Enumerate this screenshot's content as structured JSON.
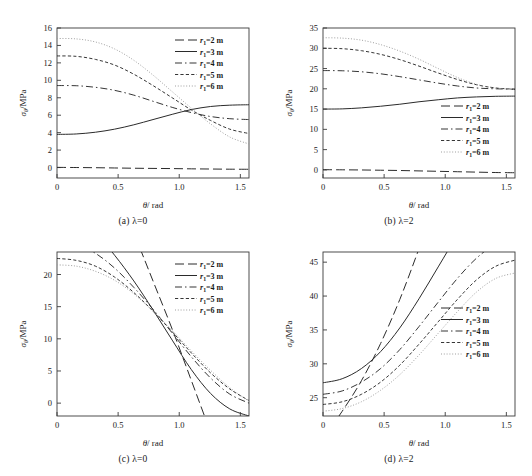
{
  "figure": {
    "panels": [
      {
        "id": "a",
        "caption": "(a)  λ=0",
        "xlabel": "θ/ rad",
        "ylabel": "σθ/MPa",
        "legend_position": "top-right"
      },
      {
        "id": "b",
        "caption": "(b)  λ=2",
        "xlabel": "θ/ rad",
        "ylabel": "σθ/MPa",
        "legend_position": "bottom-right"
      },
      {
        "id": "c",
        "caption": "(c)  λ=0",
        "xlabel": "θ/ rad",
        "ylabel": "σθ/MPa",
        "legend_position": "top-right"
      },
      {
        "id": "d",
        "caption": "(d)  λ=2",
        "xlabel": "θ/ rad",
        "ylabel": "σθ/MPa",
        "legend_position": "middle-right"
      }
    ],
    "legend_entries": [
      {
        "label_pre": "r",
        "label_sub": "1",
        "label_post": "=2 m",
        "style": "dashed"
      },
      {
        "label_pre": "r",
        "label_sub": "1",
        "label_post": "=3 m",
        "style": "solid"
      },
      {
        "label_pre": "r",
        "label_sub": "1",
        "label_post": "=4 m",
        "style": "dashdot"
      },
      {
        "label_pre": "r",
        "label_sub": "1",
        "label_post": "=5 m",
        "style": "shortdash"
      },
      {
        "label_pre": "r",
        "label_sub": "1",
        "label_post": "=6 m",
        "style": "dotted"
      }
    ]
  },
  "chart_data": [
    {
      "panel": "a",
      "type": "line",
      "title": "(a) λ=0",
      "xlabel": "θ/ rad",
      "ylabel": "σθ/MPa",
      "xlim": [
        0,
        1.5708
      ],
      "ylim": [
        -1.2,
        16
      ],
      "xticks": [
        0,
        0.5,
        1.0,
        1.5
      ],
      "xticklabels": [
        "0",
        "0.5",
        "1.0",
        "1.5"
      ],
      "yticks": [
        0,
        2,
        4,
        6,
        8,
        10,
        12,
        14,
        16
      ],
      "yticklabels": [
        "0",
        "2",
        "4",
        "6",
        "8",
        "10",
        "12",
        "14",
        "16"
      ],
      "grid": false,
      "legend": "top-right",
      "x": [
        0,
        0.1571,
        0.3142,
        0.4712,
        0.6283,
        0.7854,
        0.9425,
        1.0996,
        1.2566,
        1.4137,
        1.5708
      ],
      "series": [
        {
          "name": "r1=2 m",
          "style": "dashed",
          "values": [
            0.02,
            0.0,
            -0.02,
            -0.05,
            -0.08,
            -0.1,
            -0.12,
            -0.15,
            -0.17,
            -0.19,
            -0.2
          ]
        },
        {
          "name": "r1=3 m",
          "style": "solid",
          "values": [
            3.8,
            3.85,
            4.05,
            4.4,
            4.9,
            5.5,
            6.1,
            6.65,
            7.0,
            7.15,
            7.2
          ]
        },
        {
          "name": "r1=4 m",
          "style": "dashdot",
          "values": [
            9.4,
            9.38,
            9.2,
            8.85,
            8.3,
            7.6,
            6.9,
            6.3,
            5.85,
            5.6,
            5.5
          ]
        },
        {
          "name": "r1=5 m",
          "style": "shortdash",
          "values": [
            12.8,
            12.75,
            12.4,
            11.75,
            10.7,
            9.4,
            8.0,
            6.6,
            5.4,
            4.4,
            3.9
          ]
        },
        {
          "name": "r1=6 m",
          "style": "dotted",
          "values": [
            14.8,
            14.75,
            14.4,
            13.6,
            12.3,
            10.6,
            8.7,
            6.8,
            5.0,
            3.5,
            2.7
          ]
        }
      ]
    },
    {
      "panel": "b",
      "type": "line",
      "title": "(b) λ=2",
      "xlabel": "θ/ rad",
      "ylabel": "σθ/MPa",
      "xlim": [
        0,
        1.5708
      ],
      "ylim": [
        -2.0,
        35
      ],
      "xticks": [
        0,
        0.5,
        1.0,
        1.5
      ],
      "xticklabels": [
        "0",
        "0.5",
        "1.0",
        "1.5"
      ],
      "yticks": [
        0,
        5,
        10,
        15,
        20,
        25,
        30,
        35
      ],
      "yticklabels": [
        "0",
        "5",
        "10",
        "15",
        "20",
        "25",
        "30",
        "35"
      ],
      "grid": false,
      "legend": "bottom-right",
      "x": [
        0,
        0.1571,
        0.3142,
        0.4712,
        0.6283,
        0.7854,
        0.9425,
        1.0996,
        1.2566,
        1.4137,
        1.5708
      ],
      "series": [
        {
          "name": "r1=2 m",
          "style": "dashed",
          "values": [
            0.05,
            0.02,
            -0.02,
            -0.08,
            -0.15,
            -0.25,
            -0.35,
            -0.45,
            -0.55,
            -0.65,
            -0.7
          ]
        },
        {
          "name": "r1=3 m",
          "style": "solid",
          "values": [
            15.0,
            15.05,
            15.3,
            15.7,
            16.2,
            16.8,
            17.3,
            17.75,
            18.0,
            18.15,
            18.2
          ]
        },
        {
          "name": "r1=4 m",
          "style": "dashdot",
          "values": [
            24.5,
            24.45,
            24.2,
            23.7,
            23.0,
            22.2,
            21.4,
            20.7,
            20.2,
            20.0,
            19.9
          ]
        },
        {
          "name": "r1=5 m",
          "style": "shortdash",
          "values": [
            30.0,
            29.9,
            29.4,
            28.5,
            27.2,
            25.6,
            23.9,
            22.3,
            21.0,
            20.2,
            19.9
          ]
        },
        {
          "name": "r1=6 m",
          "style": "dotted",
          "values": [
            32.6,
            32.5,
            32.0,
            30.9,
            29.3,
            27.3,
            25.0,
            22.8,
            21.1,
            20.2,
            19.9
          ]
        }
      ]
    },
    {
      "panel": "c",
      "type": "line",
      "title": "(c) λ=0",
      "xlabel": "θ/ rad",
      "ylabel": "σθ/MPa",
      "xlim": [
        0,
        1.5708
      ],
      "ylim": [
        -2.0,
        23.5
      ],
      "xticks": [
        0,
        0.5,
        1.0,
        1.5
      ],
      "xticklabels": [
        "0",
        "0.5",
        "1.0",
        "1.5"
      ],
      "yticks": [
        0,
        5,
        10,
        15,
        20
      ],
      "yticklabels": [
        "0",
        "5",
        "10",
        "15",
        "20"
      ],
      "grid": false,
      "legend": "top-right",
      "x": [
        0,
        0.1571,
        0.3142,
        0.4712,
        0.6283,
        0.7854,
        0.9425,
        1.0996,
        1.2566,
        1.4137,
        1.5708
      ],
      "series": [
        {
          "name": "r1=2 m",
          "style": "dashed",
          "values": [
            58.0,
            50.0,
            42.0,
            34.0,
            26.5,
            19.0,
            11.5,
            3.5,
            -4.5,
            -12.0,
            -20.0
          ]
        },
        {
          "name": "r1=3 m",
          "style": "solid",
          "values": [
            31.0,
            29.0,
            26.5,
            23.0,
            19.0,
            14.5,
            9.8,
            5.2,
            1.5,
            -0.9,
            -2.0
          ]
        },
        {
          "name": "r1=4 m",
          "style": "dashdot",
          "values": [
            25.5,
            24.8,
            23.3,
            21.0,
            18.0,
            14.6,
            10.9,
            7.2,
            3.9,
            1.4,
            0.0
          ]
        },
        {
          "name": "r1=5 m",
          "style": "shortdash",
          "values": [
            22.5,
            22.2,
            21.3,
            19.6,
            17.2,
            14.3,
            11.1,
            7.8,
            4.7,
            2.2,
            0.4
          ]
        },
        {
          "name": "r1=6 m",
          "style": "dotted",
          "values": [
            21.5,
            21.3,
            20.5,
            19.1,
            17.0,
            14.3,
            11.3,
            8.1,
            5.1,
            2.4,
            0.3
          ]
        }
      ]
    },
    {
      "panel": "d",
      "type": "line",
      "title": "(d) λ=2",
      "xlabel": "θ/ rad",
      "ylabel": "σθ/MPa",
      "xlim": [
        0,
        1.5708
      ],
      "ylim": [
        22.3,
        46.5
      ],
      "xticks": [
        0,
        0.5,
        1.0,
        1.5
      ],
      "xticklabels": [
        "0",
        "0.5",
        "1.0",
        "1.5"
      ],
      "yticks": [
        25,
        30,
        35,
        40,
        45
      ],
      "yticklabels": [
        "25",
        "30",
        "35",
        "40",
        "45"
      ],
      "grid": false,
      "legend": "middle-right",
      "x": [
        0,
        0.1571,
        0.3142,
        0.4712,
        0.6283,
        0.7854,
        0.9425,
        1.0996,
        1.2566,
        1.4137,
        1.5708
      ],
      "series": [
        {
          "name": "r1=2 m",
          "style": "dashed",
          "values": [
            19.0,
            23.0,
            27.5,
            33.0,
            39.5,
            47.0,
            55.0,
            64.0,
            74.0,
            85.0,
            96.0
          ]
        },
        {
          "name": "r1=3 m",
          "style": "solid",
          "values": [
            27.2,
            27.8,
            29.3,
            31.8,
            35.3,
            39.6,
            44.3,
            49.0,
            53.2,
            56.2,
            57.5
          ]
        },
        {
          "name": "r1=4 m",
          "style": "dashdot",
          "values": [
            25.5,
            26.0,
            27.3,
            29.3,
            32.1,
            35.5,
            39.1,
            42.6,
            45.6,
            47.7,
            48.6
          ]
        },
        {
          "name": "r1=5 m",
          "style": "shortdash",
          "values": [
            24.0,
            24.4,
            25.5,
            27.3,
            29.8,
            32.9,
            36.2,
            39.5,
            42.4,
            44.4,
            45.3
          ]
        },
        {
          "name": "r1=6 m",
          "style": "dotted",
          "values": [
            23.0,
            23.4,
            24.4,
            26.1,
            28.4,
            31.3,
            34.5,
            37.7,
            40.6,
            42.6,
            43.4
          ]
        }
      ]
    }
  ]
}
